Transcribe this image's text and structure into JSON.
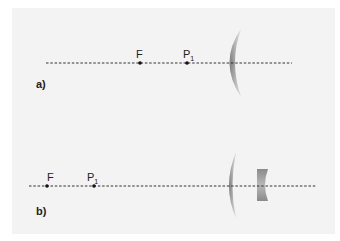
{
  "diagram": {
    "title": "",
    "panels": [
      {
        "id": "a",
        "label": "a)",
        "points": [
          {
            "name": "F",
            "x": 140
          },
          {
            "name": "P",
            "subscript": "1",
            "x": 187
          }
        ],
        "elements": [
          "converging-meniscus-lens"
        ]
      },
      {
        "id": "b",
        "label": "b)",
        "points": [
          {
            "name": "F",
            "x": 47
          },
          {
            "name": "P",
            "subscript": "1",
            "x": 94
          }
        ],
        "elements": [
          "converging-meniscus-lens",
          "diverging-lens"
        ]
      }
    ],
    "colors": {
      "background": "#ffffff",
      "panel": "#f3f3f3",
      "axis": "#333333",
      "lens_dark": "#7a7a7a",
      "lens_light": "#d4d4d4"
    }
  }
}
